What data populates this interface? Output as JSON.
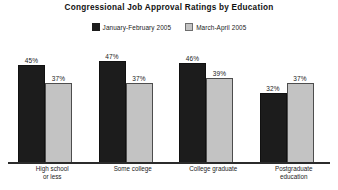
{
  "chart_data": {
    "type": "bar",
    "title": "Congressional Job Approval Ratings by Education",
    "xlabel": "",
    "ylabel": "",
    "ylim": [
      0,
      52
    ],
    "grid": false,
    "legend_position": "top-center",
    "value_suffix": "%",
    "categories": [
      "High school or less",
      "Some college",
      "College graduate",
      "Postgraduate education"
    ],
    "category_lines": [
      [
        "High school",
        "or less"
      ],
      [
        "Some college"
      ],
      [
        "College graduate"
      ],
      [
        "Postgraduate",
        "education"
      ]
    ],
    "series": [
      {
        "name": "January-February 2005",
        "color": "#1c1c1c",
        "values": [
          45,
          47,
          46,
          32
        ],
        "labels": [
          "45%",
          "47%",
          "46%",
          "32%"
        ]
      },
      {
        "name": "March-April 2005",
        "color": "#c3c3c3",
        "values": [
          37,
          37,
          39,
          37
        ],
        "labels": [
          "37%",
          "37%",
          "39%",
          "37%"
        ]
      }
    ]
  }
}
